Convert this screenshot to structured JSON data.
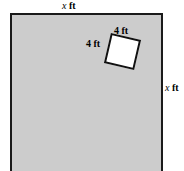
{
  "figure": {
    "name": "square-plot-with-tilted-square-cutout",
    "type": "geometry-diagram",
    "outer_square": {
      "fill_color": "#cccccc",
      "stroke_color": "#1a1a1a",
      "top_label": {
        "variable": "x",
        "unit": "ft",
        "text": "x ft"
      },
      "right_label": {
        "variable": "x",
        "unit": "ft",
        "text": "x ft"
      }
    },
    "inner_square": {
      "fill_color": "#ffffff",
      "stroke_color": "#111111",
      "rotation_degrees": 13,
      "top_label": {
        "value": "4",
        "unit": "ft",
        "text": "4 ft"
      },
      "left_label": {
        "value": "4",
        "unit": "ft",
        "text": "4 ft"
      }
    }
  },
  "labels": {
    "top_x": {
      "var": "x",
      "unit": "ft"
    },
    "right_x": {
      "var": "x",
      "unit": "ft"
    },
    "inner_top": "4 ft",
    "inner_left": "4 ft"
  }
}
